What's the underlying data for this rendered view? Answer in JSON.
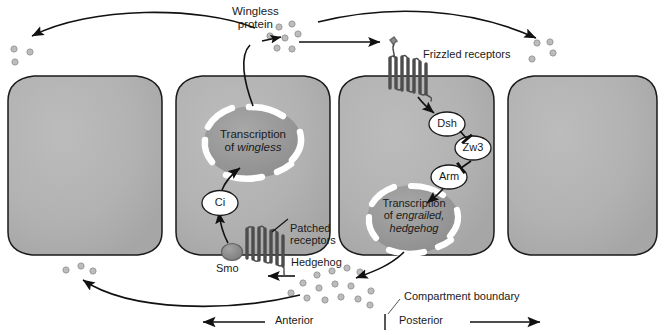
{
  "figure": {
    "type": "biological-pathway-diagram",
    "colors": {
      "cell_fill": "#b0b0b0",
      "cell_fill_light": "#bdbdbd",
      "cell_stroke": "#1a1a1a",
      "nucleus_fill": "#9a9a9a",
      "nucleus_ring": "#ffffff",
      "ligand_dot": "#b8b8b8",
      "ligand_dot_stroke": "#8f8f8f",
      "receptor": "#4a4a4a",
      "text": "#1a1a1a",
      "smo_fill": "#8c8c8c"
    }
  },
  "labels": {
    "wingless_protein": "Wingless\nprotein",
    "wingless_protein_line1": "Wingless",
    "wingless_protein_line2": "protein",
    "frizzled_receptors": "Frizzled receptors",
    "patched_receptors_line1": "Patched",
    "patched_receptors_line2": "receptors",
    "hedgehog": "Hedgehog",
    "smo": "Smo",
    "ci": "Ci",
    "dsh": "Dsh",
    "zw3": "Zw3",
    "arm": "Arm",
    "compartment_boundary": "Compartment boundary",
    "anterior": "Anterior",
    "posterior": "Posterior"
  },
  "transcription_nodes": [
    {
      "id": "wingless-nucleus",
      "line1": "Transcription",
      "line2_prefix": "of ",
      "line2_gene": "wingless",
      "genes": [
        "wingless"
      ]
    },
    {
      "id": "engrailed-hedgehog-nucleus",
      "line1": "Transcription",
      "line2_prefix": "of ",
      "line2_gene": "engrailed,",
      "line3_gene": "hedgehog",
      "genes": [
        "engrailed",
        "hedgehog"
      ]
    }
  ],
  "signaling_molecules": [
    {
      "name": "Dsh",
      "cell": 3,
      "order": 1
    },
    {
      "name": "Zw3",
      "cell": 3,
      "order": 2
    },
    {
      "name": "Arm",
      "cell": 3,
      "order": 3
    },
    {
      "name": "Ci",
      "cell": 2,
      "order": 1
    },
    {
      "name": "Smo",
      "cell": 2,
      "order": 2
    }
  ],
  "cells": [
    {
      "index": 1,
      "compartment": "anterior"
    },
    {
      "index": 2,
      "compartment": "anterior"
    },
    {
      "index": 3,
      "compartment": "posterior"
    },
    {
      "index": 4,
      "compartment": "posterior"
    }
  ],
  "axis": {
    "left_label": "Anterior",
    "right_label": "Posterior",
    "left_arrow_direction": "left",
    "right_arrow_direction": "right",
    "boundary_marker": "vertical-tick"
  }
}
